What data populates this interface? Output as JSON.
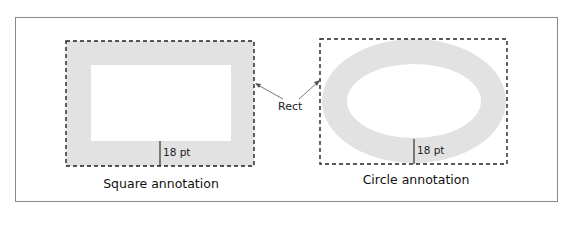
{
  "diagram": {
    "rect_label": "Rect",
    "square": {
      "caption": "Square annotation",
      "border_width_label": "18 pt"
    },
    "circle": {
      "caption": "Circle annotation",
      "border_width_label": "18 pt"
    },
    "colors": {
      "border_fill": "#e2e2e2",
      "dashed_rect": "#222222",
      "frame": "#8a8a8a"
    }
  }
}
